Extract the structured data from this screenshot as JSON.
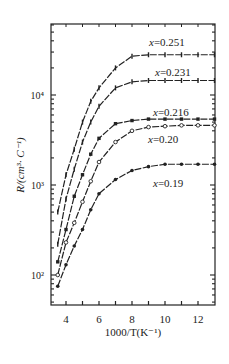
{
  "chart_data": {
    "type": "line",
    "title": "",
    "xlabel": "1000/T(K⁻¹)",
    "ylabel": "R/(cm³· C⁻¹)",
    "xscale": "linear",
    "yscale": "log",
    "xlim": [
      3.2,
      13
    ],
    "ylim": [
      45,
      60000
    ],
    "xticks": [
      4,
      6,
      8,
      10,
      12
    ],
    "xtick_labels": [
      "4",
      "6",
      "8",
      "10",
      "12"
    ],
    "yticks": [
      100,
      1000,
      10000
    ],
    "ytick_labels": [
      "10²",
      "10³",
      "10⁴"
    ],
    "grid": false,
    "legend": "inline labels",
    "x": [
      3.5,
      4,
      4.5,
      5,
      5.5,
      6,
      7,
      8,
      9,
      10,
      11,
      12,
      13
    ],
    "series": [
      {
        "name": "x=0.251",
        "marker": "tick",
        "values": [
          500,
          1300,
          2500,
          5000,
          8500,
          12000,
          20000,
          27000,
          28000,
          28000,
          28000,
          28000,
          28000
        ]
      },
      {
        "name": "x=0.231",
        "marker": "tick",
        "values": [
          220,
          700,
          1500,
          3000,
          5000,
          7500,
          12000,
          14000,
          14500,
          14500,
          14500,
          14500,
          14500
        ]
      },
      {
        "name": "x=0.216",
        "marker": "filled-square",
        "values": [
          140,
          320,
          750,
          1300,
          2200,
          3300,
          4800,
          5200,
          5400,
          5400,
          5400,
          5400,
          5400
        ]
      },
      {
        "name": "x=0.20",
        "marker": "open-circle",
        "values": [
          100,
          230,
          380,
          650,
          1100,
          1800,
          3000,
          4000,
          4400,
          4500,
          4600,
          4600,
          4600
        ]
      },
      {
        "name": "x=0.19",
        "marker": "filled-circle",
        "values": [
          75,
          130,
          210,
          320,
          530,
          800,
          1150,
          1450,
          1600,
          1700,
          1700,
          1700,
          1700
        ]
      }
    ]
  },
  "labels": {
    "s0": "x=0.251",
    "s1": "x=0.231",
    "s2": "x=0.216",
    "s3": "x=0.20",
    "s4": "x=0.19"
  }
}
